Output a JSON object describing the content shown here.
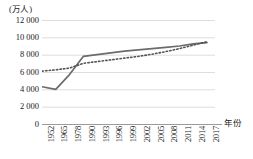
{
  "chart_data": {
    "type": "line",
    "title": "",
    "subtitle": "",
    "ylabel": "(万人)",
    "xlabel": "年份",
    "ylim": [
      0,
      12000
    ],
    "grid": true,
    "legend_position": "none",
    "y_ticks": [
      "0",
      "2 000",
      "4 000",
      "6 000",
      "8 000",
      "10 000",
      "12 000"
    ],
    "y_tick_values": [
      0,
      2000,
      4000,
      6000,
      8000,
      10000,
      12000
    ],
    "categories": [
      "1952",
      "1965",
      "1978",
      "1990",
      "1993",
      "1996",
      "1999",
      "2002",
      "2005",
      "2008",
      "2011",
      "2014",
      "2017"
    ],
    "series": [
      {
        "name": "实线",
        "style": "solid",
        "color": "#6b6b6b",
        "values": [
          4300,
          4000,
          5700,
          7800,
          8000,
          8200,
          8400,
          8550,
          8700,
          8850,
          9000,
          9250,
          9400
        ]
      },
      {
        "name": "趋势线",
        "style": "dotted",
        "color": "#555555",
        "values": [
          6100,
          6250,
          6450,
          7000,
          7200,
          7400,
          7600,
          7800,
          8050,
          8350,
          8700,
          9100,
          9500
        ]
      }
    ],
    "colors": {
      "solid_line": "#6b6b6b",
      "dotted_line": "#555555",
      "gridline": "#d4d4d4",
      "axis": "#9b9b9b",
      "text": "#1a1a1a",
      "background": "#ffffff"
    }
  }
}
